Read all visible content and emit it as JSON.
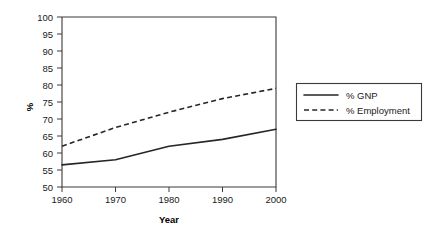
{
  "chart_data": {
    "type": "line",
    "title": "",
    "xlabel": "Year",
    "ylabel": "%",
    "x": [
      1960,
      1970,
      1980,
      1990,
      2000
    ],
    "xtick_labels": [
      "1960",
      "1970",
      "1980",
      "1990",
      "2000"
    ],
    "ytick_labels": [
      "50",
      "55",
      "60",
      "65",
      "70",
      "75",
      "80",
      "85",
      "90",
      "95",
      "100"
    ],
    "ytick_values": [
      50,
      55,
      60,
      65,
      70,
      75,
      80,
      85,
      90,
      95,
      100
    ],
    "xlim": [
      1960,
      2000
    ],
    "ylim": [
      50,
      100
    ],
    "grid": false,
    "legend_position": "right",
    "series": [
      {
        "name": "% GNP",
        "style": "solid",
        "color": "#262626",
        "values": [
          56.5,
          58.0,
          62.0,
          64.0,
          67.0
        ]
      },
      {
        "name": "% Employment",
        "style": "dashed",
        "color": "#262626",
        "values": [
          62.0,
          67.5,
          72.0,
          76.0,
          79.0
        ]
      }
    ]
  },
  "axes": {
    "y_axis_label": "%",
    "x_axis_label": "Year"
  },
  "legend": {
    "entries": [
      {
        "label": "% GNP",
        "style": "solid"
      },
      {
        "label": "% Employment",
        "style": "dashed"
      }
    ]
  },
  "colors": {
    "line": "#262626",
    "frame": "#3b3b3b",
    "text": "#1a1a1a",
    "background": "#ffffff"
  }
}
